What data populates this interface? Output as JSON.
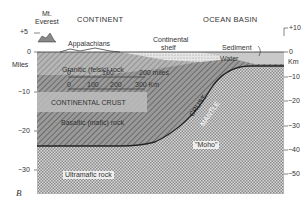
{
  "diagram": {
    "panel_label": "B",
    "regions": {
      "continent": "CONTINENT",
      "ocean_basin": "OCEAN BASIN"
    },
    "features": {
      "mt_everest_line1": "Mt.",
      "mt_everest_line2": "Everest",
      "appalachians": "Appalachians",
      "continental_shelf_line1": "Continental",
      "continental_shelf_line2": "shelf",
      "sediment": "Sediment",
      "water": "Water"
    },
    "layers": {
      "granitic": "Granitic (felsic) rock",
      "continental_crust": "CONTINENTAL CRUST",
      "basaltic": "Basaltic (mafic) rock",
      "ultramafic": "Ultramafic rock",
      "crust": "CRUST",
      "mantle": "MANTLE",
      "moho": "\"Moho\""
    },
    "scale_bar": {
      "miles_ticks": [
        "0",
        "100",
        "200 miles"
      ],
      "km_ticks": [
        "0",
        "100",
        "200",
        "300 Km"
      ]
    },
    "left_axis": {
      "unit": "Miles",
      "ticks": [
        "+5",
        "0",
        "−10",
        "−20",
        "−30"
      ]
    },
    "right_axis": {
      "unit": "Km",
      "ticks": [
        "+10",
        "0",
        "−10",
        "−20",
        "−30",
        "−40",
        "−50"
      ]
    }
  }
}
